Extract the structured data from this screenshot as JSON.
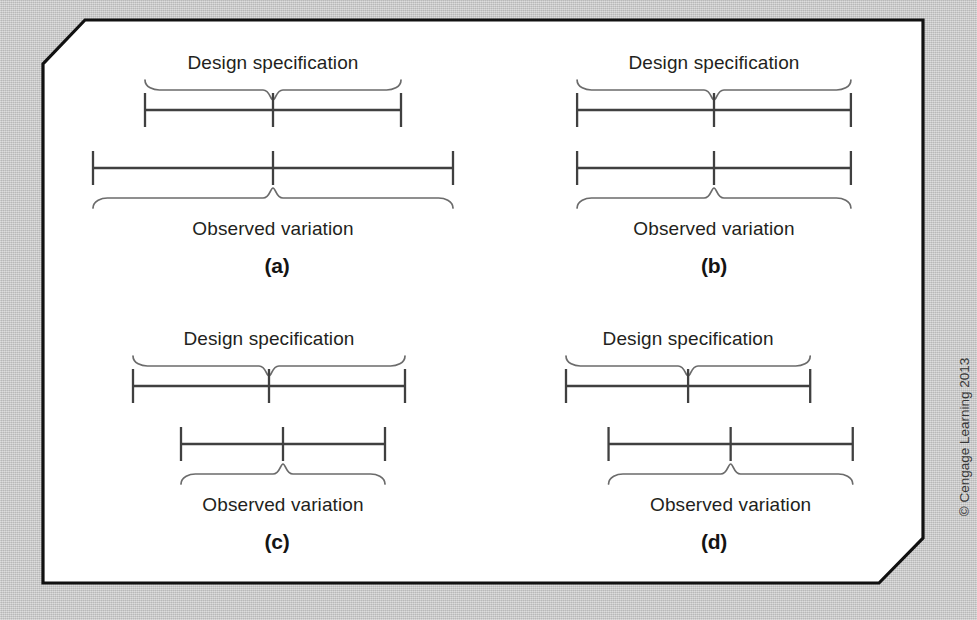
{
  "figure": {
    "copyright": "© Cengage Learning 2013",
    "background_color": "#cacaca",
    "card_color": "#ffffff",
    "line_color": "#404040",
    "brace_color": "#6b6b6b",
    "spec_label": "Design specification",
    "observed_label": "Observed variation"
  },
  "chart_data": {
    "type": "diagram",
    "xlabel": "",
    "ylabel": "",
    "xlim": [
      0,
      100
    ],
    "grid": false,
    "legend": "none",
    "panels": [
      {
        "id": "a",
        "caption": "(a)",
        "meaning": "Observed variation wider than design specification",
        "spec": {
          "label": "Design specification",
          "start": 17.0,
          "end": 81.0,
          "center": 49.0
        },
        "observed": {
          "label": "Observed variation",
          "start": 4.0,
          "end": 94.0,
          "center": 49.0
        }
      },
      {
        "id": "b",
        "caption": "(b)",
        "meaning": "Observed variation equal to design specification",
        "spec": {
          "label": "Design specification",
          "start": 13.0,
          "end": 87.0,
          "center": 50.0
        },
        "observed": {
          "label": "Observed variation",
          "start": 13.0,
          "end": 87.0,
          "center": 50.0
        }
      },
      {
        "id": "c",
        "caption": "(c)",
        "meaning": "Observed variation narrower than design specification",
        "spec": {
          "label": "Design specification",
          "start": 14.0,
          "end": 82.0,
          "center": 48.0
        },
        "observed": {
          "label": "Observed variation",
          "start": 26.0,
          "end": 77.0,
          "center": 51.5
        }
      },
      {
        "id": "d",
        "caption": "(d)",
        "meaning": "Observed variation shifted right of design specification",
        "spec": {
          "label": "Design specification",
          "start": 10.0,
          "end": 76.0,
          "center": 43.0
        },
        "observed": {
          "label": "Observed variation",
          "start": 21.5,
          "end": 87.5,
          "center": 54.5
        }
      }
    ]
  }
}
